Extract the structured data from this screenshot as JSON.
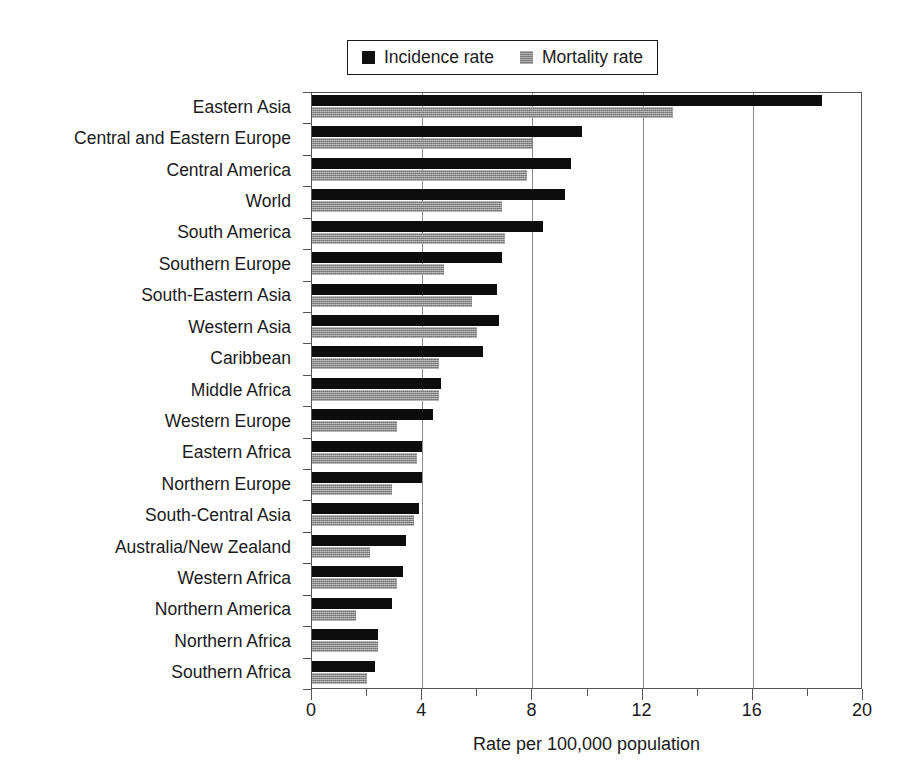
{
  "chart_data": {
    "type": "bar",
    "orientation": "horizontal",
    "title": "",
    "xlabel": "Rate per 100,000 population",
    "ylabel": "",
    "xlim": [
      0,
      20
    ],
    "xticks": [
      0,
      4,
      8,
      12,
      16,
      20
    ],
    "xticklabels": [
      "0",
      "4",
      "8",
      "12",
      "16",
      "20"
    ],
    "minor_xticks": [
      2,
      6,
      10,
      14,
      18
    ],
    "grid": "vertical gridlines at major ticks 4, 8, 12, 16",
    "legend_position": "top-center",
    "categories": [
      "Eastern Asia",
      "Central and Eastern Europe",
      "Central America",
      "World",
      "South America",
      "Southern Europe",
      "South-Eastern Asia",
      "Western Asia",
      "Caribbean",
      "Middle Africa",
      "Western Europe",
      "Eastern Africa",
      "Northern Europe",
      "South-Central Asia",
      "Australia/New Zealand",
      "Western Africa",
      "Northern America",
      "Northern Africa",
      "Southern Africa"
    ],
    "series": [
      {
        "name": "Incidence rate",
        "color": "#0d0d0d",
        "values": [
          18.5,
          9.8,
          9.4,
          9.2,
          8.4,
          6.9,
          6.7,
          6.8,
          6.2,
          4.7,
          4.4,
          4.0,
          4.0,
          3.9,
          3.4,
          3.3,
          2.9,
          2.4,
          2.3
        ]
      },
      {
        "name": "Mortality rate",
        "color": "#8c8c8c",
        "values": [
          13.1,
          8.0,
          7.8,
          6.9,
          7.0,
          4.8,
          5.8,
          6.0,
          4.6,
          4.6,
          3.1,
          3.8,
          2.9,
          3.7,
          2.1,
          3.1,
          1.6,
          2.4,
          2.0
        ]
      }
    ]
  },
  "legend": {
    "entries": [
      {
        "label": "Incidence rate",
        "swatch": "incidence"
      },
      {
        "label": "Mortality rate",
        "swatch": "mortality"
      }
    ]
  }
}
